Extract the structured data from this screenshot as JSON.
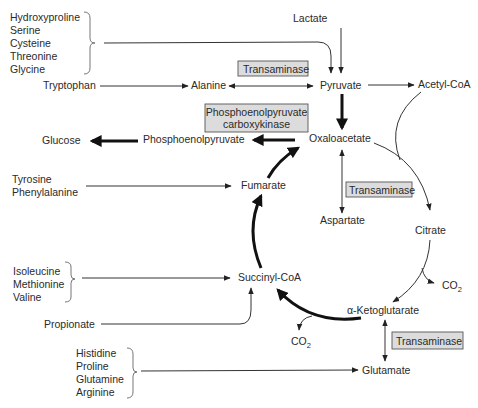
{
  "diagram": {
    "type": "metabolic-pathway",
    "groups": {
      "top_left": [
        "Hydroxyproline",
        "Serine",
        "Cysteine",
        "Threonine",
        "Glycine"
      ],
      "mid_left": [
        "Tyrosine",
        "Phenylalanine"
      ],
      "succinyl_sources": [
        "Isoleucine",
        "Methionine",
        "Valine"
      ],
      "bottom_left": [
        "Histidine",
        "Proline",
        "Glutamine",
        "Arginine"
      ]
    },
    "nodes": {
      "lactate": "Lactate",
      "tryptophan": "Tryptophan",
      "alanine": "Alanine",
      "pyruvate": "Pyruvate",
      "acetyl_coa": "Acetyl-CoA",
      "glucose": "Glucose",
      "pep": "Phosphoenolpyruvate",
      "oxaloacetate": "Oxaloacetate",
      "fumarate": "Fumarate",
      "aspartate": "Aspartate",
      "citrate": "Citrate",
      "succinyl_coa": "Succinyl-CoA",
      "alpha_kg": "α-Ketoglutarate",
      "propionate": "Propionate",
      "glutamate": "Glutamate",
      "co2_main": "CO",
      "co2_sub": "2"
    },
    "enzymes": {
      "transaminase_alanine": "Transaminase",
      "pepck_line1": "Phosphoenolpyruvate",
      "pepck_line2": "carboxykinase",
      "transaminase_aspartate": "Transaminase",
      "transaminase_glutamate": "Transaminase"
    },
    "colors": {
      "enzyme_box_fill": "#dcdcdc",
      "line": "#222222",
      "text": "#2a2a2a"
    }
  }
}
